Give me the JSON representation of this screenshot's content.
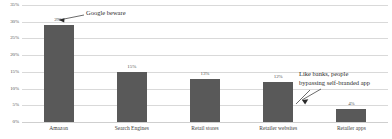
{
  "chart_data": {
    "type": "bar",
    "title": "",
    "subtitle": "",
    "xlabel": "",
    "ylabel": "",
    "categories": [
      "Amazon",
      "Search Engines",
      "Retail stores",
      "Retailer websites",
      "Retailer apps"
    ],
    "values": [
      29,
      15,
      13,
      12,
      4
    ],
    "data_labels": [
      "29%",
      "15%",
      "13%",
      "12%",
      "4%"
    ],
    "ylim": [
      0,
      35
    ],
    "ytick_values": [
      0,
      5,
      10,
      15,
      20,
      25,
      30,
      35
    ],
    "ytick_labels": [
      "0%",
      "5%",
      "10%",
      "15%",
      "20%",
      "25%",
      "30%",
      "35%"
    ],
    "grid": true,
    "legend": false,
    "legend_position": "none",
    "series": [
      {
        "name": "Share of shoppers",
        "values": [
          29,
          15,
          13,
          12,
          4
        ],
        "color": "#595959"
      }
    ],
    "annotations": [
      {
        "id": "left",
        "text": "Google beware",
        "target_category": "Amazon"
      },
      {
        "id": "right",
        "text": "Like banks, people\nbypassing self-branded app",
        "target_category": "Retailer apps"
      }
    ]
  },
  "colors": {
    "bar": "#595959",
    "gridline": "#d9d9d9",
    "axis_text": "#555555",
    "annotation_text": "#2b2b2b",
    "background": "#ffffff"
  }
}
